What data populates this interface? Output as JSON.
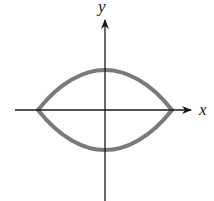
{
  "diagram": {
    "type": "axes-with-closed-curve",
    "axes": {
      "x_label": "x",
      "y_label": "y",
      "origin": [
        105,
        110
      ],
      "x_range_px": [
        15,
        192
      ],
      "y_range_px": [
        20,
        201
      ]
    },
    "curve": {
      "description": "lens-shaped closed curve symmetric about both axes, cusps on x-axis",
      "left_cusp": [
        38,
        110
      ],
      "right_cusp": [
        172,
        110
      ],
      "top": [
        105,
        70
      ],
      "bottom": [
        105,
        150
      ],
      "stroke_color": "#7a7a7a"
    },
    "colors": {
      "axis": "#1a1a1a",
      "curve": "#7a7a7a",
      "background": "#ffffff"
    }
  }
}
